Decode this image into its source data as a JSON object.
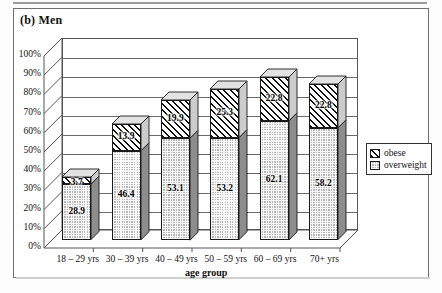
{
  "panel": {
    "title": "(b) Men"
  },
  "chart_data": {
    "type": "bar",
    "subtype": "stacked-column-3d",
    "title": "(b) Men",
    "xlabel": "age group",
    "ylabel": "",
    "ylim": [
      0,
      100
    ],
    "ytick_labels": [
      "100%",
      "90%",
      "80%",
      "70%",
      "60%",
      "50%",
      "40%",
      "30%",
      "20%",
      "10%",
      "0%"
    ],
    "ytick_values": [
      100,
      90,
      80,
      70,
      60,
      50,
      40,
      30,
      20,
      10,
      0
    ],
    "grid": true,
    "legend_position": "right",
    "categories": [
      "18 – 29 yrs",
      "30 – 39 yrs",
      "40 – 49 yrs",
      "50 – 59 yrs",
      "60 – 69 yrs",
      "70+ yrs"
    ],
    "series": [
      {
        "name": "overweight",
        "pattern": "stipple-gray",
        "values": [
          28.9,
          46.4,
          53.1,
          53.2,
          62.1,
          58.2
        ]
      },
      {
        "name": "obese",
        "pattern": "diagonal-hatch",
        "values": [
          3.7,
          13.9,
          19.9,
          25.3,
          22.8,
          22.8
        ]
      }
    ],
    "data_labels": {
      "overweight": [
        "28.9",
        "46.4",
        "53.1",
        "53.2",
        "62.1",
        "58.2"
      ],
      "obese": [
        "3.7",
        "13.9",
        "19.9",
        "25.3",
        "22.8",
        "22.8"
      ]
    },
    "totals": [
      32.6,
      60.3,
      73.0,
      78.5,
      84.9,
      81.0
    ]
  },
  "legend": {
    "items": [
      {
        "label": "obese"
      },
      {
        "label": "overweight"
      }
    ]
  },
  "axis": {
    "x_title": "age group"
  },
  "colors": {
    "ink": "#111111",
    "grid": "#6a6a6a",
    "overweight_fill": "#b8b8b8",
    "obese_fill": "#ffffff",
    "frame": "#6f6f6f"
  }
}
